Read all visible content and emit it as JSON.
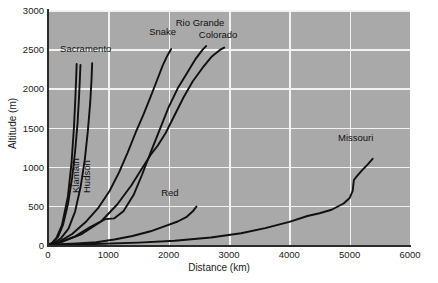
{
  "chart_data": {
    "type": "line",
    "title": "",
    "xlabel": "Distance (km)",
    "ylabel": "Altitude (m)",
    "xlim": [
      0,
      6000
    ],
    "ylim": [
      0,
      3000
    ],
    "xticks": [
      0,
      1000,
      2000,
      3000,
      4000,
      5000,
      6000
    ],
    "yticks": [
      0,
      500,
      1000,
      1500,
      2000,
      2500,
      3000
    ],
    "xtick_labels": [
      "0",
      "1000",
      "2000",
      "3000",
      "4000",
      "5000",
      "6000"
    ],
    "ytick_labels": [
      "0",
      "500",
      "1000",
      "1500",
      "2000",
      "2500",
      "3000"
    ],
    "grid": true,
    "legend_position": "inline-annotations",
    "plot_background": "#a9a9a9",
    "grid_color": "#f2f2f2",
    "line_color": "#101010",
    "series": [
      {
        "name": "Sacramento",
        "label_x": 625,
        "label_y": 2430,
        "label_orientation": "horizontal",
        "points": [
          [
            0,
            0
          ],
          [
            60,
            20
          ],
          [
            140,
            90
          ],
          [
            230,
            250
          ],
          [
            330,
            620
          ],
          [
            390,
            1050
          ],
          [
            430,
            1500
          ],
          [
            455,
            1900
          ],
          [
            468,
            2150
          ],
          [
            475,
            2310
          ]
        ]
      },
      {
        "name": "Klamath",
        "label_x": 430,
        "label_y": 1020,
        "label_orientation": "vertical",
        "points": [
          [
            0,
            0
          ],
          [
            80,
            30
          ],
          [
            170,
            110
          ],
          [
            250,
            260
          ],
          [
            330,
            520
          ],
          [
            400,
            860
          ],
          [
            450,
            1200
          ],
          [
            490,
            1560
          ],
          [
            515,
            1900
          ],
          [
            530,
            2150
          ],
          [
            538,
            2300
          ]
        ]
      },
      {
        "name": "Hudson",
        "label_x": 610,
        "label_y": 1020,
        "label_orientation": "vertical",
        "points": [
          [
            0,
            0
          ],
          [
            100,
            25
          ],
          [
            220,
            90
          ],
          [
            340,
            210
          ],
          [
            450,
            430
          ],
          [
            540,
            740
          ],
          [
            610,
            1090
          ],
          [
            660,
            1450
          ],
          [
            700,
            1820
          ],
          [
            722,
            2120
          ],
          [
            732,
            2320
          ]
        ]
      },
      {
        "name": "Snake",
        "label_x": 1900,
        "label_y": 2640,
        "label_orientation": "horizontal",
        "points": [
          [
            0,
            0
          ],
          [
            180,
            40
          ],
          [
            400,
            140
          ],
          [
            620,
            290
          ],
          [
            830,
            470
          ],
          [
            1020,
            690
          ],
          [
            1180,
            930
          ],
          [
            1320,
            1180
          ],
          [
            1450,
            1430
          ],
          [
            1580,
            1660
          ],
          [
            1700,
            1890
          ],
          [
            1810,
            2110
          ],
          [
            1900,
            2290
          ],
          [
            1980,
            2420
          ],
          [
            2040,
            2500
          ]
        ]
      },
      {
        "name": "Rio Grande",
        "label_x": 2520,
        "label_y": 2760,
        "label_orientation": "horizontal",
        "points": [
          [
            0,
            0
          ],
          [
            200,
            35
          ],
          [
            450,
            110
          ],
          [
            700,
            230
          ],
          [
            950,
            330
          ],
          [
            1100,
            340
          ],
          [
            1250,
            430
          ],
          [
            1420,
            640
          ],
          [
            1560,
            900
          ],
          [
            1700,
            1180
          ],
          [
            1850,
            1470
          ],
          [
            2000,
            1760
          ],
          [
            2150,
            2000
          ],
          [
            2300,
            2190
          ],
          [
            2450,
            2380
          ],
          [
            2560,
            2490
          ],
          [
            2620,
            2540
          ]
        ]
      },
      {
        "name": "Colorado",
        "label_x": 2820,
        "label_y": 2600,
        "label_orientation": "horizontal",
        "points": [
          [
            0,
            0
          ],
          [
            250,
            45
          ],
          [
            560,
            140
          ],
          [
            880,
            300
          ],
          [
            1150,
            520
          ],
          [
            1380,
            760
          ],
          [
            1560,
            980
          ],
          [
            1700,
            1150
          ],
          [
            1820,
            1270
          ],
          [
            1950,
            1430
          ],
          [
            2100,
            1660
          ],
          [
            2250,
            1890
          ],
          [
            2400,
            2090
          ],
          [
            2560,
            2260
          ],
          [
            2720,
            2410
          ],
          [
            2850,
            2490
          ],
          [
            2920,
            2520
          ]
        ]
      },
      {
        "name": "Red",
        "label_x": 2020,
        "label_y": 590,
        "label_orientation": "horizontal",
        "points": [
          [
            0,
            0
          ],
          [
            200,
            10
          ],
          [
            480,
            20
          ],
          [
            800,
            35
          ],
          [
            1100,
            70
          ],
          [
            1400,
            115
          ],
          [
            1700,
            175
          ],
          [
            1950,
            245
          ],
          [
            2150,
            300
          ],
          [
            2300,
            360
          ],
          [
            2400,
            430
          ],
          [
            2460,
            490
          ]
        ]
      },
      {
        "name": "Missouri",
        "label_x": 5100,
        "label_y": 1290,
        "label_orientation": "horizontal",
        "points": [
          [
            0,
            0
          ],
          [
            400,
            5
          ],
          [
            900,
            15
          ],
          [
            1500,
            30
          ],
          [
            2100,
            55
          ],
          [
            2700,
            95
          ],
          [
            3200,
            150
          ],
          [
            3600,
            215
          ],
          [
            4000,
            295
          ],
          [
            4300,
            370
          ],
          [
            4500,
            405
          ],
          [
            4700,
            450
          ],
          [
            4900,
            530
          ],
          [
            5000,
            600
          ],
          [
            5050,
            690
          ],
          [
            5070,
            830
          ],
          [
            5120,
            880
          ],
          [
            5200,
            950
          ],
          [
            5300,
            1030
          ],
          [
            5380,
            1100
          ]
        ]
      }
    ]
  }
}
